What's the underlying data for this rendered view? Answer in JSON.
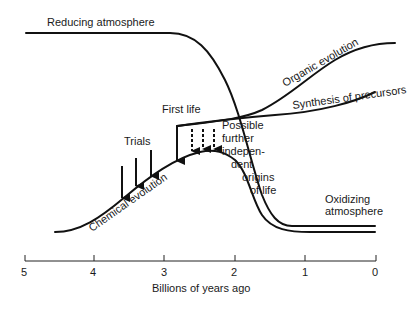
{
  "diagram": {
    "curves": {
      "reducing_atmosphere": "Reducing atmosphere",
      "oxidizing_atmosphere_line1": "Oxidizing",
      "oxidizing_atmosphere_line2": "atmosphere",
      "organic_evolution": "Organic evolution",
      "synthesis_of_precursors": "Synthesis of precursors",
      "chemical_evolution": "Chemical evolution"
    },
    "annotations": {
      "first_life": "First life",
      "trials": "Trials",
      "possible_origins": [
        "Possible",
        "further",
        "indepen-",
        "dent",
        "origins",
        "of life"
      ]
    },
    "axis": {
      "label": "Billions of years ago",
      "ticks": [
        "5",
        "4",
        "3",
        "2",
        "1",
        "0"
      ]
    },
    "colors": {
      "line": "#111111",
      "background": "#ffffff"
    }
  }
}
